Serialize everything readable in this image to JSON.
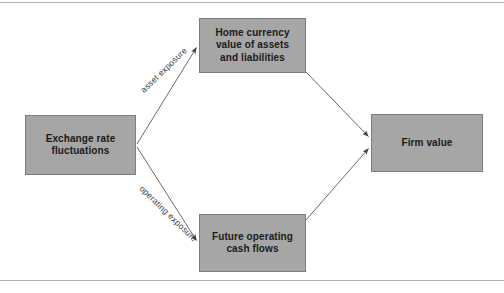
{
  "figure": {
    "background_color": "#ffffff",
    "node_fill_color": "#a6a6a6",
    "node_border_color": "#7d7d7d",
    "line_color": "#595959",
    "rule_color": "#b0b0b0",
    "text_color": "#1a1a1a"
  },
  "nodes": {
    "exchange_rate": {
      "line1": "Exchange rate",
      "line2": "fluctuations"
    },
    "home_currency": {
      "line1": "Home currency",
      "line2": "value of assets",
      "line3": "and liabilities"
    },
    "future_cash_flows": {
      "line1": "Future operating",
      "line2": "cash flows"
    },
    "firm_value": {
      "line1": "Firm value"
    }
  },
  "edge_labels": {
    "asset_exposure": "asset exposure",
    "operating_exposure": "operating exposure"
  }
}
